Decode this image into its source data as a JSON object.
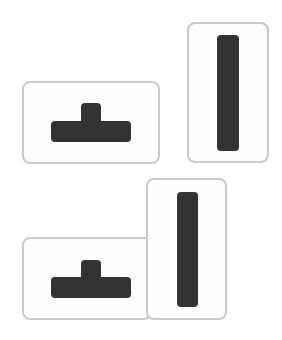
{
  "colors": {
    "shape_fill": "#333333",
    "box_border": "#c9c9c9",
    "box_fill": "#fdfdfd",
    "background": "#ffffff"
  },
  "groups": [
    {
      "name": "top-group",
      "boxes": [
        {
          "name": "t-piece-box",
          "x": 22,
          "y": 81,
          "w": 138,
          "h": 83,
          "shape": "t-piece",
          "parts": [
            {
              "x": 81,
              "y": 103,
              "w": 20,
              "h": 24
            },
            {
              "x": 51,
              "y": 121,
              "w": 80,
              "h": 21
            }
          ]
        },
        {
          "name": "i-piece-box",
          "x": 187,
          "y": 22,
          "w": 82,
          "h": 141,
          "shape": "i-piece",
          "parts": [
            {
              "x": 217,
              "y": 35,
              "w": 22,
              "h": 116
            }
          ]
        }
      ]
    },
    {
      "name": "bottom-group",
      "boxes": [
        {
          "name": "t-piece-box",
          "x": 22,
          "y": 237,
          "w": 130,
          "h": 83,
          "shape": "t-piece",
          "parts": [
            {
              "x": 81,
              "y": 260,
              "w": 20,
              "h": 24
            },
            {
              "x": 51,
              "y": 277,
              "w": 80,
              "h": 21
            }
          ]
        },
        {
          "name": "i-piece-box",
          "x": 146,
          "y": 178,
          "w": 81,
          "h": 142,
          "shape": "i-piece",
          "parts": [
            {
              "x": 177,
              "y": 192,
              "w": 21,
              "h": 115
            }
          ]
        }
      ]
    }
  ]
}
